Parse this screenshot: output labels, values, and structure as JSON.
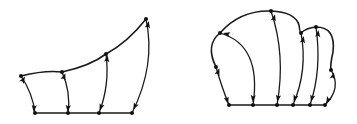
{
  "figure": {
    "width": 357,
    "height": 124,
    "colors": {
      "stroke": "#1a1a1a",
      "node": "#111111",
      "background": "#ffffff"
    },
    "panels": [
      {
        "id": "left-diagram",
        "baseline": [
          [
            35,
            113
          ],
          [
            68,
            113
          ],
          [
            99,
            113
          ],
          [
            132,
            113
          ]
        ],
        "boundary_curve": "M21,76 Q45,70 62,72 Q90,66 106,54 Q128,42 146,19",
        "top_nodes": [
          [
            21,
            76
          ],
          [
            62,
            72
          ],
          [
            106,
            54
          ],
          [
            146,
            19
          ]
        ],
        "edges": [
          {
            "path": "M21,76 Q33,94 35,113",
            "arrows": [
              [
                23,
                80,
                -60
              ],
              [
                34,
                108,
                95
              ]
            ]
          },
          {
            "path": "M62,72 Q71,92 68,113",
            "arrows": [
              [
                64,
                77,
                -70
              ],
              [
                68,
                108,
                95
              ]
            ]
          },
          {
            "path": "M106,54 Q110,85 99,113",
            "arrows": [
              [
                107,
                59,
                -85
              ],
              [
                101,
                107,
                110
              ]
            ]
          },
          {
            "path": "M146,19 Q156,65 132,113",
            "arrows": [
              [
                148,
                25,
                -80
              ],
              [
                135,
                106,
                115
              ]
            ]
          }
        ]
      },
      {
        "id": "right-diagram",
        "baseline": [
          [
            229,
            105
          ],
          [
            253,
            105
          ],
          [
            277,
            105
          ],
          [
            293,
            105
          ],
          [
            310,
            105
          ],
          [
            325,
            105
          ]
        ],
        "boundary_curve": "M216,67 Q205,45 220,33 Q240,10 271,11 Q295,12 299,25 Q300,33 301,33 Q306,28 316,27 Q336,27 333,52 Q330,65 331,70",
        "top_nodes": [
          [
            216,
            67
          ],
          [
            220,
            33
          ],
          [
            271,
            11
          ],
          [
            301,
            33
          ],
          [
            316,
            27
          ],
          [
            331,
            70
          ]
        ],
        "edges": [
          {
            "path": "M216,67 Q222,88 229,105",
            "arrows": [
              [
                218,
                72,
                -70
              ],
              [
                227,
                100,
                75
              ]
            ]
          },
          {
            "path": "M220,33 Q262,45 253,105",
            "arrows": [
              [
                227,
                34,
                -165
              ],
              [
                253,
                98,
                95
              ]
            ]
          },
          {
            "path": "M271,11 Q286,55 277,105",
            "arrows": [
              [
                274,
                18,
                -75
              ],
              [
                278,
                98,
                100
              ]
            ]
          },
          {
            "path": "M301,33 Q308,70 293,105",
            "arrows": [
              [
                303,
                40,
                -80
              ],
              [
                295,
                98,
                110
              ]
            ]
          },
          {
            "path": "M316,27 Q322,70 310,105",
            "arrows": [
              [
                318,
                34,
                -85
              ],
              [
                312,
                98,
                105
              ]
            ]
          },
          {
            "path": "M331,70 Q342,88 325,105",
            "arrows": [
              [
                333,
                76,
                -75
              ],
              [
                328,
                100,
                120
              ]
            ]
          }
        ]
      }
    ]
  }
}
